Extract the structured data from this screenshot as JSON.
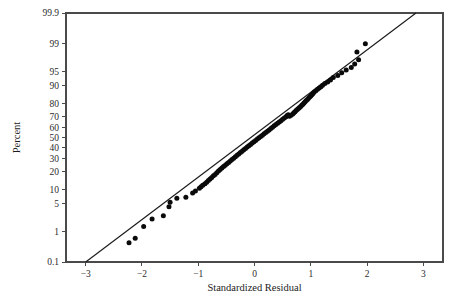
{
  "chart_data": {
    "type": "scatter",
    "title": "",
    "subtitle": "",
    "xlabel": "Standardized Residual",
    "ylabel": "Percent",
    "xlim": [
      -3.35,
      3.35
    ],
    "ylim_percent": [
      0.1,
      99.9
    ],
    "grid": false,
    "legend": null,
    "plot_kind": "normal-probability-plot",
    "y_scale": "normal-probability",
    "x_ticks": [
      -3,
      -2,
      -1,
      0,
      1,
      2,
      3
    ],
    "x_tick_labels": [
      "−3",
      "−2",
      "−1",
      "0",
      "1",
      "2",
      "3"
    ],
    "y_ticks_percent": [
      0.1,
      1,
      5,
      10,
      20,
      30,
      40,
      50,
      60,
      70,
      80,
      90,
      95,
      99,
      99.9
    ],
    "y_tick_labels": [
      "0.1",
      "1",
      "5",
      "10",
      "20",
      "30",
      "40",
      "50",
      "60",
      "70",
      "80",
      "90",
      "95",
      "99",
      "99.9"
    ],
    "reference_line": {
      "description": "45-degree normal reference line",
      "x_start": -3.0,
      "percent_start": 0.1,
      "x_end": 2.87,
      "percent_end": 99.9
    },
    "points": [
      {
        "x": -2.23,
        "percent": 0.45
      },
      {
        "x": -2.12,
        "percent": 0.62
      },
      {
        "x": -1.97,
        "percent": 1.35
      },
      {
        "x": -1.82,
        "percent": 2.15
      },
      {
        "x": -1.62,
        "percent": 2.6
      },
      {
        "x": -1.52,
        "percent": 4.3
      },
      {
        "x": -1.5,
        "percent": 5.4
      },
      {
        "x": -1.38,
        "percent": 6.6
      },
      {
        "x": -1.22,
        "percent": 6.9
      },
      {
        "x": -1.1,
        "percent": 8.4
      },
      {
        "x": -1.05,
        "percent": 9.2
      },
      {
        "x": -0.98,
        "percent": 10.4
      },
      {
        "x": -0.95,
        "percent": 11.1
      },
      {
        "x": -0.92,
        "percent": 11.8
      },
      {
        "x": -0.88,
        "percent": 12.6
      },
      {
        "x": -0.85,
        "percent": 13.4
      },
      {
        "x": -0.82,
        "percent": 14.3
      },
      {
        "x": -0.79,
        "percent": 15.2
      },
      {
        "x": -0.76,
        "percent": 16.1
      },
      {
        "x": -0.73,
        "percent": 17.1
      },
      {
        "x": -0.7,
        "percent": 18.0
      },
      {
        "x": -0.67,
        "percent": 19.1
      },
      {
        "x": -0.64,
        "percent": 20.2
      },
      {
        "x": -0.61,
        "percent": 21.3
      },
      {
        "x": -0.58,
        "percent": 22.4
      },
      {
        "x": -0.55,
        "percent": 23.5
      },
      {
        "x": -0.52,
        "percent": 24.6
      },
      {
        "x": -0.49,
        "percent": 25.7
      },
      {
        "x": -0.46,
        "percent": 26.8
      },
      {
        "x": -0.43,
        "percent": 28.0
      },
      {
        "x": -0.4,
        "percent": 29.2
      },
      {
        "x": -0.37,
        "percent": 30.4
      },
      {
        "x": -0.34,
        "percent": 31.6
      },
      {
        "x": -0.31,
        "percent": 32.9
      },
      {
        "x": -0.28,
        "percent": 34.1
      },
      {
        "x": -0.25,
        "percent": 35.4
      },
      {
        "x": -0.22,
        "percent": 36.7
      },
      {
        "x": -0.19,
        "percent": 38.0
      },
      {
        "x": -0.16,
        "percent": 39.3
      },
      {
        "x": -0.13,
        "percent": 40.6
      },
      {
        "x": -0.1,
        "percent": 41.9
      },
      {
        "x": -0.07,
        "percent": 43.2
      },
      {
        "x": -0.04,
        "percent": 44.5
      },
      {
        "x": -0.01,
        "percent": 45.8
      },
      {
        "x": 0.02,
        "percent": 47.1
      },
      {
        "x": 0.05,
        "percent": 48.4
      },
      {
        "x": 0.08,
        "percent": 49.7
      },
      {
        "x": 0.11,
        "percent": 51.0
      },
      {
        "x": 0.14,
        "percent": 52.3
      },
      {
        "x": 0.17,
        "percent": 53.6
      },
      {
        "x": 0.2,
        "percent": 54.9
      },
      {
        "x": 0.23,
        "percent": 56.2
      },
      {
        "x": 0.26,
        "percent": 57.5
      },
      {
        "x": 0.29,
        "percent": 58.8
      },
      {
        "x": 0.32,
        "percent": 60.1
      },
      {
        "x": 0.35,
        "percent": 61.4
      },
      {
        "x": 0.38,
        "percent": 62.6
      },
      {
        "x": 0.41,
        "percent": 63.8
      },
      {
        "x": 0.44,
        "percent": 65.0
      },
      {
        "x": 0.47,
        "percent": 66.2
      },
      {
        "x": 0.5,
        "percent": 67.4
      },
      {
        "x": 0.53,
        "percent": 68.5
      },
      {
        "x": 0.56,
        "percent": 69.6
      },
      {
        "x": 0.58,
        "percent": 70.7
      },
      {
        "x": 0.6,
        "percent": 71.3
      },
      {
        "x": 0.62,
        "percent": 70.2
      },
      {
        "x": 0.65,
        "percent": 71.0
      },
      {
        "x": 0.68,
        "percent": 72.1
      },
      {
        "x": 0.7,
        "percent": 73.0
      },
      {
        "x": 0.72,
        "percent": 73.9
      },
      {
        "x": 0.74,
        "percent": 74.8
      },
      {
        "x": 0.76,
        "percent": 75.6
      },
      {
        "x": 0.78,
        "percent": 76.4
      },
      {
        "x": 0.8,
        "percent": 77.2
      },
      {
        "x": 0.82,
        "percent": 78.0
      },
      {
        "x": 0.84,
        "percent": 78.8
      },
      {
        "x": 0.86,
        "percent": 79.6
      },
      {
        "x": 0.88,
        "percent": 80.4
      },
      {
        "x": 0.9,
        "percent": 81.2
      },
      {
        "x": 0.92,
        "percent": 82.0
      },
      {
        "x": 0.94,
        "percent": 82.8
      },
      {
        "x": 0.96,
        "percent": 83.5
      },
      {
        "x": 0.98,
        "percent": 84.2
      },
      {
        "x": 1.0,
        "percent": 84.9
      },
      {
        "x": 1.02,
        "percent": 85.6
      },
      {
        "x": 1.04,
        "percent": 86.3
      },
      {
        "x": 1.06,
        "percent": 87.0
      },
      {
        "x": 1.09,
        "percent": 87.7
      },
      {
        "x": 1.12,
        "percent": 88.4
      },
      {
        "x": 1.15,
        "percent": 89.0
      },
      {
        "x": 1.18,
        "percent": 89.6
      },
      {
        "x": 1.21,
        "percent": 90.3
      },
      {
        "x": 1.25,
        "percent": 91.0
      },
      {
        "x": 1.3,
        "percent": 91.6
      },
      {
        "x": 1.35,
        "percent": 92.3
      },
      {
        "x": 1.4,
        "percent": 93.2
      },
      {
        "x": 1.48,
        "percent": 93.8
      },
      {
        "x": 1.55,
        "percent": 94.6
      },
      {
        "x": 1.63,
        "percent": 95.3
      },
      {
        "x": 1.72,
        "percent": 95.9
      },
      {
        "x": 1.78,
        "percent": 96.6
      },
      {
        "x": 1.85,
        "percent": 97.3
      },
      {
        "x": 1.82,
        "percent": 98.3
      },
      {
        "x": 1.97,
        "percent": 99.0
      }
    ],
    "dense_band": {
      "description": "overlapping points form a continuous dark band between x=-0.95 and x=1.2",
      "x_from": -0.95,
      "x_to": 1.2
    }
  },
  "colors": {
    "background": "#ffffff",
    "axis": "#4a4a4a",
    "text": "#1c1c1c",
    "point": "#0a0a0a",
    "line": "#1a1a1a"
  }
}
